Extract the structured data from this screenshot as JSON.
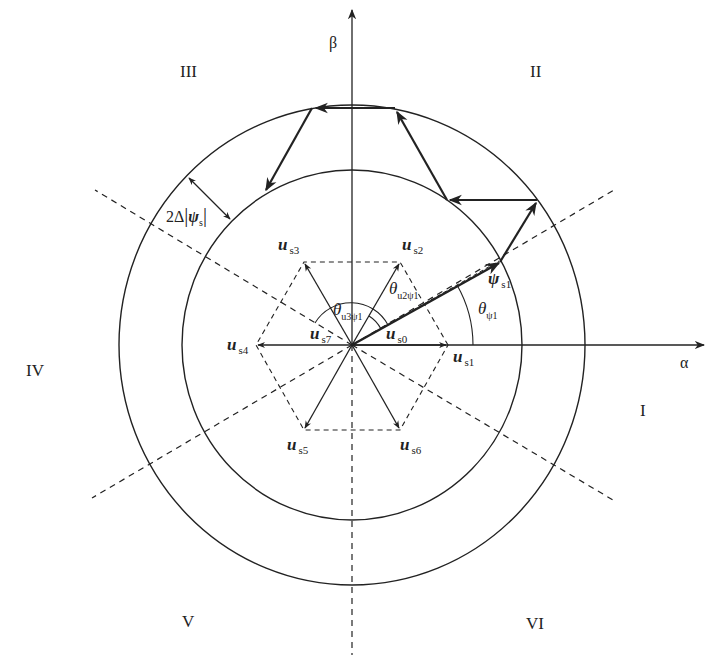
{
  "diagram": {
    "type": "voltage-space-vector-and-stator-flux-trajectory",
    "axes": {
      "alpha": "α",
      "beta": "β"
    },
    "sectors": [
      "I",
      "II",
      "III",
      "IV",
      "V",
      "VI"
    ],
    "vectors": {
      "us0": {
        "sym": "u",
        "sub": "s0"
      },
      "us1": {
        "sym": "u",
        "sub": "s1"
      },
      "us2": {
        "sym": "u",
        "sub": "s2"
      },
      "us3": {
        "sym": "u",
        "sub": "s3"
      },
      "us4": {
        "sym": "u",
        "sub": "s4"
      },
      "us5": {
        "sym": "u",
        "sub": "s5"
      },
      "us6": {
        "sym": "u",
        "sub": "s6"
      },
      "us7": {
        "sym": "u",
        "sub": "s7"
      }
    },
    "flux": {
      "sym": "ψ",
      "sub": "s1"
    },
    "angles": {
      "theta_psi1": {
        "sym": "θ",
        "sub": "ψ1"
      },
      "theta_u2psi1": {
        "sym": "θ",
        "sub": "u2ψ1"
      },
      "theta_u3psi1": {
        "sym": "θ",
        "sub": "u3ψ1"
      }
    },
    "band": {
      "prefix": "2Δ",
      "sym": "ψ",
      "sub": "s"
    },
    "colors": {
      "line": "#222222",
      "background": "#ffffff"
    }
  }
}
